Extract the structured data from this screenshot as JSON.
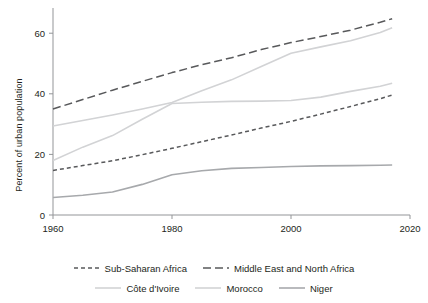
{
  "chart_data": {
    "type": "line",
    "title": "",
    "xlabel": "",
    "ylabel": "Percent of urban population",
    "xlim": [
      1960,
      2020
    ],
    "ylim": [
      0,
      67
    ],
    "xticks": [
      1960,
      1980,
      2000,
      2020
    ],
    "yticks": [
      0,
      20,
      40,
      60
    ],
    "grid": false,
    "legend_position": "bottom",
    "x": [
      1960,
      1965,
      1970,
      1975,
      1980,
      1985,
      1990,
      1995,
      2000,
      2005,
      2010,
      2015,
      2017
    ],
    "series": [
      {
        "name": "Sub-Saharan Africa",
        "style": "dashed-short",
        "color": "#58595b",
        "values": [
          14.7,
          16.3,
          17.9,
          19.9,
          22.0,
          24.2,
          26.4,
          28.7,
          30.9,
          33.3,
          35.8,
          38.4,
          39.6
        ]
      },
      {
        "name": "Middle East and North Africa",
        "style": "dashed-long",
        "color": "#58595b",
        "values": [
          35.0,
          38.1,
          41.2,
          44.1,
          47.0,
          49.6,
          51.9,
          54.6,
          56.9,
          58.9,
          61.0,
          63.6,
          64.8
        ]
      },
      {
        "name": "Côte d'Ivoire",
        "style": "solid",
        "color": "#d2d3d5",
        "values": [
          18.0,
          22.4,
          26.2,
          31.6,
          36.8,
          37.2,
          37.5,
          37.6,
          37.8,
          38.9,
          40.8,
          42.5,
          43.5
        ]
      },
      {
        "name": "Morocco",
        "style": "solid",
        "color": "#d2d3d5",
        "values": [
          29.4,
          31.2,
          33.0,
          35.0,
          37.1,
          41.0,
          44.6,
          49.0,
          53.4,
          55.5,
          57.5,
          60.2,
          61.8
        ]
      },
      {
        "name": "Niger",
        "style": "solid",
        "color": "#a7a9ac",
        "values": [
          5.8,
          6.5,
          7.6,
          10.1,
          13.3,
          14.6,
          15.4,
          15.7,
          16.0,
          16.2,
          16.3,
          16.4,
          16.5
        ]
      }
    ]
  },
  "legend": {
    "row1": [
      {
        "label": "Sub-Saharan Africa",
        "style": "dashed-short",
        "color": "#58595b"
      },
      {
        "label": "Middle East and North Africa",
        "style": "dashed-long",
        "color": "#58595b"
      }
    ],
    "row2": [
      {
        "label": "Côte d'Ivoire",
        "style": "solid",
        "color": "#d2d3d5"
      },
      {
        "label": "Morocco",
        "style": "solid",
        "color": "#d2d3d5"
      },
      {
        "label": "Niger",
        "style": "solid",
        "color": "#a7a9ac"
      }
    ]
  },
  "axis": {
    "ylabel": "Percent of urban population",
    "xtick_labels": [
      "1960",
      "1980",
      "2000",
      "2020"
    ],
    "ytick_labels": [
      "0",
      "20",
      "40",
      "60"
    ]
  }
}
